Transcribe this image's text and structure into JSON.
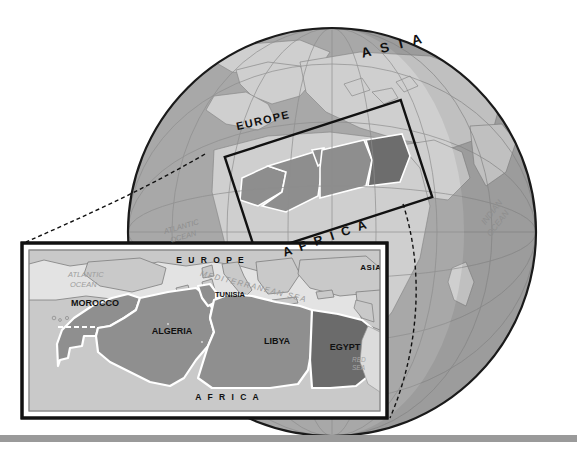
{
  "figure": {
    "type": "locator-map",
    "background_color": "#ffffff",
    "baseline_bar_color": "#9a9a9a"
  },
  "globe": {
    "name": "globe",
    "ocean_color": "#a8a8a8",
    "land_color": "#cfcfcf",
    "highlight_land_color": "#8f8f8f",
    "highlight_dark_color": "#6e6e6e",
    "outline_color": "#1a1a1a",
    "graticule_color": "#8d8d8d",
    "center_x": 332,
    "center_y": 232,
    "radius": 204,
    "labels": [
      {
        "name": "globe-label-asia",
        "text": "A S I A",
        "x": 394,
        "y": 50,
        "rotate": -14,
        "size": 13.5,
        "style": "cap"
      },
      {
        "name": "globe-label-europe",
        "text": "EUROPE",
        "x": 264,
        "y": 124,
        "rotate": -13,
        "size": 11,
        "style": "cap"
      },
      {
        "name": "globe-label-africa",
        "text": "A F R I C A",
        "x": 327,
        "y": 242,
        "rotate": -19,
        "size": 12.5,
        "style": "cap"
      },
      {
        "name": "globe-label-atlantic-ocean",
        "text": "ATLANTIC",
        "x": 182,
        "y": 229,
        "rotate": -16,
        "size": 7.5,
        "style": "ocean"
      },
      {
        "name": "globe-label-atlantic-ocean-2",
        "text": "OCEAN",
        "x": 184,
        "y": 239,
        "rotate": -16,
        "size": 7.5,
        "style": "ocean"
      },
      {
        "name": "globe-label-indian-ocean",
        "text": "INDIAN",
        "x": 494,
        "y": 214,
        "rotate": -52,
        "size": 8.5,
        "style": "ocean"
      },
      {
        "name": "globe-label-indian-ocean-2",
        "text": "OCEAN",
        "x": 500,
        "y": 225,
        "rotate": -52,
        "size": 8.5,
        "style": "ocean"
      }
    ],
    "callout_box": {
      "name": "globe-callout-box",
      "rotate": -18,
      "x": 236,
      "y": 126,
      "width": 185,
      "height": 102,
      "stroke": "#111111",
      "stroke_width": 2.2
    }
  },
  "leader_lines": {
    "name": "leader-lines",
    "style": "dashed",
    "color": "#111111",
    "dash": "4 3"
  },
  "inset": {
    "name": "inset-map",
    "frame": {
      "outer_x": 22,
      "outer_y": 243,
      "outer_w": 365,
      "outer_h": 175,
      "outer_stroke": "#111111",
      "outer_stroke_width": 3,
      "inner_stroke": "#8a8a8a",
      "inner_stroke_width": 1,
      "gap": 5
    },
    "sea_color": "#e3e3e3",
    "land_color": "#c9c9c9",
    "country_color": "#8f8f8f",
    "egypt_color": "#6b6b6b",
    "border_color": "#ffffff",
    "coast_color": "#7d7d7d",
    "countries": [
      {
        "name": "country-label-morocco",
        "label": "MOROCCO",
        "x": 95,
        "y": 306,
        "size": 9
      },
      {
        "name": "country-label-algeria",
        "label": "ALGERIA",
        "x": 172,
        "y": 334,
        "size": 9
      },
      {
        "name": "country-label-tunisia",
        "label": "TUNISIA",
        "x": 230,
        "y": 297,
        "size": 7.5
      },
      {
        "name": "country-label-libya",
        "label": "LIBYA",
        "x": 277,
        "y": 344,
        "size": 9
      },
      {
        "name": "country-label-egypt",
        "label": "EGYPT",
        "x": 345,
        "y": 350,
        "size": 9
      }
    ],
    "region_labels": [
      {
        "name": "inset-label-europe",
        "text": "E U R O P E",
        "x": 211,
        "y": 263,
        "size": 8.5
      },
      {
        "name": "inset-label-asia",
        "text": "ASIA",
        "x": 371,
        "y": 270,
        "size": 8
      },
      {
        "name": "inset-label-africa",
        "text": "A F R I C A",
        "x": 228,
        "y": 400,
        "size": 8.5
      }
    ],
    "water_labels": [
      {
        "name": "inset-label-atlantic-ocean",
        "text": "ATLANTIC",
        "x": 68,
        "y": 277,
        "size": 7.5,
        "rotate": 0
      },
      {
        "name": "inset-label-atlantic-ocean-2",
        "text": "OCEAN",
        "x": 70,
        "y": 287,
        "size": 7.5,
        "rotate": 0
      },
      {
        "name": "inset-label-mediterranean-sea",
        "text": "MEDITERRANEAN  SEA",
        "x": 253,
        "y": 289,
        "size": 8,
        "rotate": 14
      },
      {
        "name": "inset-label-red-sea",
        "text": "RED",
        "x": 352,
        "y": 362,
        "size": 6.5,
        "rotate": 0
      },
      {
        "name": "inset-label-red-sea-2",
        "text": "SEA",
        "x": 352,
        "y": 370,
        "size": 6.5,
        "rotate": 0
      }
    ]
  }
}
